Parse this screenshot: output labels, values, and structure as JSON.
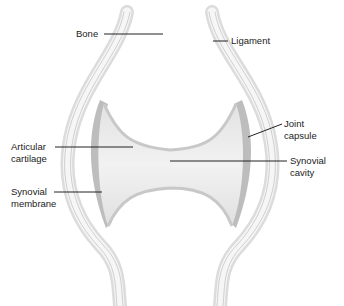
{
  "labels": {
    "bone": "Bone",
    "ligament": "Ligament",
    "joint_capsule_1": "Joint",
    "joint_capsule_2": "capsule",
    "articular_cartilage_1": "Articular",
    "articular_cartilage_2": "cartilage",
    "synovial_cavity_1": "Synovial",
    "synovial_cavity_2": "cavity",
    "synovial_membrane_1": "Synovial",
    "synovial_membrane_2": "membrane"
  },
  "colors": {
    "background": "#ffffff",
    "bone_fill": "#f4f4f4",
    "capsule_stroke": "#d0d0d0",
    "membrane_fill": "#b8b8b8",
    "cartilage_fill": "#e6e6e6",
    "leader_line": "#222222"
  }
}
